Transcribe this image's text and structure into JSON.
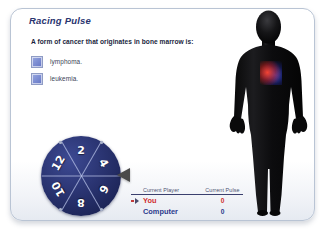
{
  "card": {
    "title": "Racing Pulse"
  },
  "quiz": {
    "question": "A form of cancer that originates in bone marrow is:",
    "options": [
      {
        "label": "lymphoma."
      },
      {
        "label": "leukemia."
      }
    ]
  },
  "wheel": {
    "segments": [
      {
        "value": "2",
        "angle": 0
      },
      {
        "value": "4",
        "angle": 60
      },
      {
        "value": "6",
        "angle": 120
      },
      {
        "value": "8",
        "angle": 180
      },
      {
        "value": "10",
        "angle": 240
      },
      {
        "value": "12",
        "angle": 300
      }
    ],
    "pointer_icon": "left-triangle-pointer-icon"
  },
  "scoreboard": {
    "headers": {
      "player": "Current Player",
      "pulse": "Current Pulse"
    },
    "rows": [
      {
        "player": "You",
        "pulse": "0",
        "active": true
      },
      {
        "player": "Computer",
        "pulse": "0",
        "active": false
      }
    ]
  },
  "figure": {
    "alt": "human-body-silhouette",
    "heart": "glowing-heart"
  },
  "colors": {
    "title": "#2a3570",
    "wheel": "#2b3573",
    "you": "#d02f2f",
    "computer": "#2b3a8c",
    "card_border": "#b9c4d4"
  }
}
